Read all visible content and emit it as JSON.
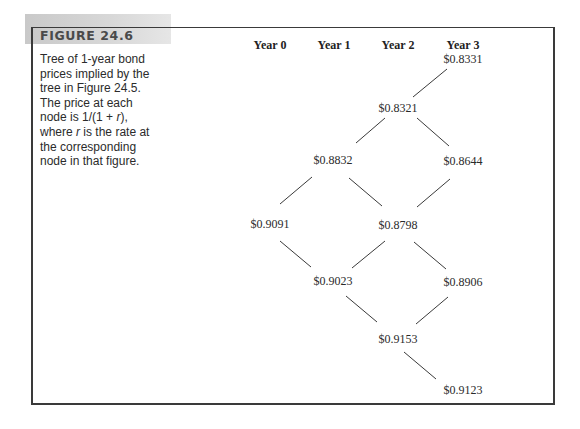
{
  "figure": {
    "label": "FIGURE 24.6",
    "caption_parts": [
      "Tree of 1-year bond prices implied by the tree in Figure 24.5. The price at each node is 1/(1 + ",
      "r",
      "), where ",
      "r",
      " is the rate at the corresponding node in that figure."
    ]
  },
  "columns": [
    {
      "label": "Year 0",
      "x": 270
    },
    {
      "label": "Year 1",
      "x": 334
    },
    {
      "label": "Year 2",
      "x": 398
    },
    {
      "label": "Year 3",
      "x": 463
    }
  ],
  "nodes": [
    {
      "id": "n0",
      "value": "$0.8331",
      "x": 463,
      "y": 63
    },
    {
      "id": "n1",
      "value": "$0.8321",
      "x": 398,
      "y": 112
    },
    {
      "id": "n2",
      "value": "$0.8832",
      "x": 333,
      "y": 164
    },
    {
      "id": "n3",
      "value": "$0.8644",
      "x": 463,
      "y": 165
    },
    {
      "id": "n4",
      "value": "$0.9091",
      "x": 270,
      "y": 228
    },
    {
      "id": "n5",
      "value": "$0.8798",
      "x": 398,
      "y": 229
    },
    {
      "id": "n6",
      "value": "$0.9023",
      "x": 333,
      "y": 285
    },
    {
      "id": "n7",
      "value": "$0.8906",
      "x": 463,
      "y": 286
    },
    {
      "id": "n8",
      "value": "$0.9153",
      "x": 398,
      "y": 343
    },
    {
      "id": "n9",
      "value": "$0.9123",
      "x": 463,
      "y": 394
    }
  ],
  "edges": [
    {
      "x1": 413,
      "y1": 97,
      "x2": 447,
      "y2": 69
    },
    {
      "x1": 356,
      "y1": 143,
      "x2": 385,
      "y2": 118
    },
    {
      "x1": 417,
      "y1": 118,
      "x2": 449,
      "y2": 146
    },
    {
      "x1": 280,
      "y1": 204,
      "x2": 312,
      "y2": 177
    },
    {
      "x1": 349,
      "y1": 178,
      "x2": 382,
      "y2": 206
    },
    {
      "x1": 417,
      "y1": 207,
      "x2": 450,
      "y2": 179
    },
    {
      "x1": 280,
      "y1": 241,
      "x2": 311,
      "y2": 267
    },
    {
      "x1": 352,
      "y1": 268,
      "x2": 385,
      "y2": 241
    },
    {
      "x1": 414,
      "y1": 242,
      "x2": 446,
      "y2": 269
    },
    {
      "x1": 346,
      "y1": 296,
      "x2": 377,
      "y2": 322
    },
    {
      "x1": 416,
      "y1": 324,
      "x2": 448,
      "y2": 297
    },
    {
      "x1": 404,
      "y1": 352,
      "x2": 436,
      "y2": 379
    }
  ]
}
